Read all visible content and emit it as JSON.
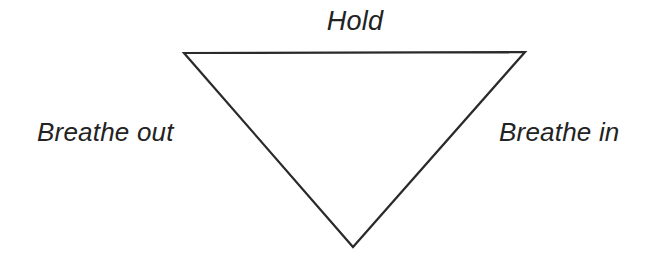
{
  "figure": {
    "background_color": "#ffffff",
    "stroke_color": "#2a2a2a",
    "text_color": "#232323",
    "width": 654,
    "height": 260
  },
  "shape": {
    "name": "inverted-triangle",
    "stroke_width": 2.2,
    "vertices": {
      "top_left": {
        "x": 184,
        "y": 53
      },
      "top_right": {
        "x": 525,
        "y": 52
      },
      "bottom_apex": {
        "x": 353,
        "y": 247
      }
    },
    "points": "184,53 525,52 353,247"
  },
  "labels": {
    "top": "Hold",
    "left": "Breathe out",
    "right": "Breathe in"
  }
}
